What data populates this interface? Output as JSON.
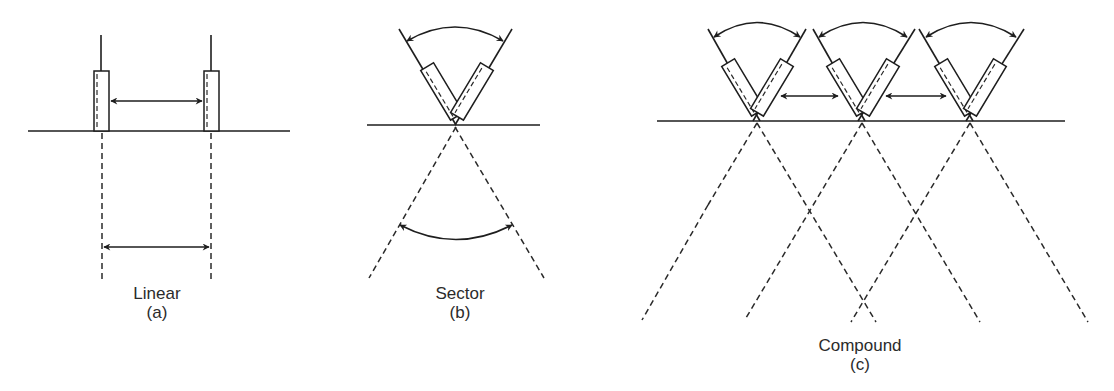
{
  "figure": {
    "panels": [
      {
        "id": "a",
        "title": "Linear",
        "caption": "(a)"
      },
      {
        "id": "b",
        "title": "Sector",
        "caption": "(b)"
      },
      {
        "id": "c",
        "title": "Compound",
        "caption": "(c)"
      }
    ]
  },
  "colors": {
    "stroke": "#1e1e1e",
    "text": "#2b2b2b",
    "background": "#ffffff"
  }
}
